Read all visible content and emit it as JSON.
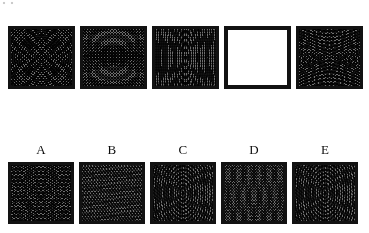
{
  "test": {
    "kind": "visual-pattern-completion",
    "format": "Raven-style matrix: top sequence with one missing cell, five lettered answer choices below",
    "colors": {
      "page_background": "#ffffff",
      "panel_border": "#121212",
      "texture_ink": "#000000",
      "texture_mid_tone": "#6e6e6e",
      "label_text": "#0d0d0d"
    }
  },
  "sequence": {
    "name": "problem-row",
    "missing_index": 3,
    "panels": [
      {
        "position": 1,
        "pattern": "radial",
        "description": "dense halftone square with concentric radial moire centered, diagonal cross rays",
        "blank": false
      },
      {
        "position": 2,
        "pattern": "diag-x",
        "description": "dense halftone square with crossing diagonal moire bands forming an X",
        "blank": false
      },
      {
        "position": 3,
        "pattern": "vaxis",
        "description": "dense halftone square with vertical centre axis and concentric elliptical moire",
        "blank": false
      },
      {
        "position": 4,
        "pattern": "blank",
        "description": "empty white square with heavy black border - the missing element",
        "blank": true
      },
      {
        "position": 5,
        "pattern": "haxis",
        "description": "dense halftone square with horizontal centre axis and wide elliptical moire",
        "blank": false
      }
    ]
  },
  "options": {
    "name": "answer-row",
    "items": [
      {
        "label": "A",
        "pattern": "diamond",
        "description": "halftone square with diamond / rhombus shaped moire figure at centre"
      },
      {
        "label": "B",
        "pattern": "bands",
        "description": "halftone square with soft sweeping diagonal moire bands, low contrast"
      },
      {
        "label": "C",
        "pattern": "cross",
        "description": "halftone square with bright vertical centre line and cross-shaped moire"
      },
      {
        "label": "D",
        "pattern": "weave",
        "description": "halftone square with fine even weave, faint central interference"
      },
      {
        "label": "E",
        "pattern": "cross",
        "description": "halftone square with vertical centre line and horizontal moire band"
      }
    ]
  }
}
